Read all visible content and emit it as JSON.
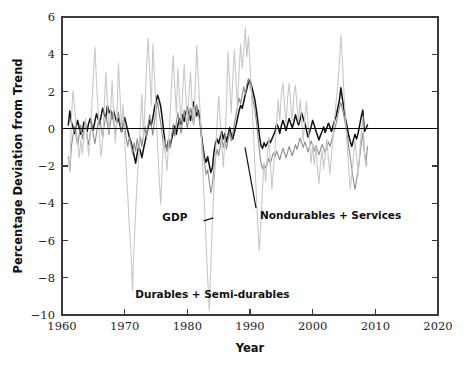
{
  "chart_data": {
    "type": "line",
    "title": "",
    "xlabel": "Year",
    "ylabel": "Percentage Deviation from Trend",
    "xlim": [
      1960,
      2020
    ],
    "ylim": [
      -10,
      6
    ],
    "xticks": [
      1960,
      1970,
      1980,
      1990,
      2000,
      2010,
      2020
    ],
    "xtick_labels": [
      "1960",
      "1970",
      "1980",
      "1990",
      "2000",
      "2010",
      "2020"
    ],
    "yticks": [
      -10,
      -8,
      -6,
      -4,
      -2,
      0,
      2,
      4,
      6
    ],
    "ytick_labels": [
      "−10",
      "−8",
      "−6",
      "−4",
      "−2",
      "0",
      "2",
      "4",
      "6"
    ],
    "grid": false,
    "legend_position": "inline-annotations",
    "zero_reference_line": 0,
    "x_start": 1961.0,
    "x_step": 0.25,
    "annotations": [
      {
        "text": "GDP",
        "x": 1980.0,
        "y": -4.95,
        "leader_to_x": 1982.6,
        "leader_to_y": -4.95
      },
      {
        "text": "Nondurables + Services",
        "x": 1991.6,
        "y": -4.85,
        "leader_to_x": 1989.2,
        "leader_to_y": -1.0
      },
      {
        "text": "Durables + Semi-durables",
        "x": 1984.0,
        "y": -9.1,
        "leader_to_x": null,
        "leader_to_y": null
      }
    ],
    "series": [
      {
        "name": "GDP",
        "color": "#111111",
        "width": 1.5,
        "values": [
          0.2,
          0.95,
          0.35,
          0.1,
          -0.25,
          0.1,
          0.45,
          0.05,
          -0.3,
          -0.1,
          0.35,
          0.2,
          -0.15,
          0.3,
          0.55,
          0.2,
          -0.05,
          0.4,
          0.8,
          0.55,
          0.25,
          0.7,
          1.1,
          0.75,
          0.55,
          1.25,
          0.85,
          1.0,
          0.55,
          0.95,
          0.6,
          0.35,
          0.55,
          0.2,
          -0.15,
          0.25,
          0.6,
          0.25,
          -0.1,
          -0.45,
          -0.7,
          -1.05,
          -1.45,
          -1.85,
          -1.35,
          -0.95,
          -1.2,
          -1.55,
          -1.1,
          -0.7,
          -0.3,
          0.05,
          0.45,
          0.2,
          0.6,
          1.1,
          1.45,
          1.8,
          1.55,
          1.2,
          0.55,
          -0.2,
          -0.85,
          -1.1,
          -0.6,
          -0.95,
          -0.55,
          -0.2,
          0.15,
          -0.3,
          0.2,
          0.55,
          0.25,
          0.75,
          0.4,
          0.85,
          1.15,
          0.85,
          0.45,
          0.9,
          1.45,
          1.05,
          0.7,
          1.0,
          0.55,
          -0.35,
          -1.0,
          -1.55,
          -1.8,
          -1.5,
          -1.95,
          -2.35,
          -2.1,
          -1.25,
          -0.75,
          -0.55,
          -0.8,
          -0.45,
          -0.15,
          -0.55,
          -0.25,
          -0.7,
          -0.35,
          0.05,
          -0.3,
          -0.55,
          -0.2,
          0.15,
          0.55,
          0.95,
          1.25,
          1.1,
          1.45,
          1.85,
          2.15,
          2.5,
          2.6,
          2.3,
          1.95,
          1.6,
          1.05,
          0.4,
          -0.35,
          -0.9,
          -1.05,
          -0.75,
          -0.95,
          -0.8,
          -0.6,
          -0.75,
          -0.55,
          -0.35,
          -0.15,
          0.25,
          0.1,
          -0.25,
          0.15,
          0.45,
          0.2,
          -0.1,
          0.25,
          0.55,
          0.3,
          0.05,
          0.35,
          0.75,
          0.45,
          0.2,
          0.5,
          0.85,
          0.55,
          0.3,
          -0.05,
          -0.45,
          -0.2,
          0.1,
          0.45,
          0.2,
          -0.1,
          -0.35,
          -0.6,
          -0.35,
          -0.15,
          0.1,
          -0.2,
          0.05,
          0.3,
          0.1,
          -0.15,
          0.15,
          0.45,
          0.7,
          1.1,
          1.5,
          2.2,
          1.6,
          1.05,
          0.55,
          0.1,
          -0.35,
          -0.7,
          -0.95,
          -0.6,
          -0.3,
          -0.55,
          -0.25,
          0.2,
          0.65,
          1.0,
          -0.15,
          0.0,
          0.2
        ]
      },
      {
        "name": "Nondurables + Services",
        "color": "#8c8c8c",
        "width": 1.1,
        "values": [
          -1.5,
          -2.25,
          -0.95,
          -0.35,
          0.1,
          -0.45,
          -0.9,
          -0.3,
          0.2,
          -0.55,
          -0.1,
          0.35,
          -0.4,
          -0.85,
          -0.3,
          0.25,
          -0.35,
          -0.8,
          -0.25,
          0.3,
          0.55,
          0.05,
          -0.45,
          0.2,
          0.7,
          0.25,
          -0.3,
          0.35,
          0.85,
          0.3,
          -0.25,
          0.4,
          0.9,
          0.35,
          -0.2,
          0.45,
          0.15,
          -0.5,
          -0.95,
          -0.45,
          -0.85,
          -1.35,
          -0.75,
          -1.2,
          -0.55,
          -1.05,
          -0.45,
          -0.95,
          -0.4,
          0.1,
          -0.45,
          0.25,
          0.75,
          0.2,
          -0.35,
          0.4,
          0.95,
          1.45,
          0.85,
          0.3,
          -0.35,
          -1.1,
          -0.65,
          -1.25,
          -0.55,
          -1.05,
          -0.35,
          0.25,
          -0.4,
          0.35,
          0.85,
          0.35,
          -0.25,
          0.45,
          1.0,
          0.5,
          0.05,
          0.6,
          1.1,
          0.65,
          0.2,
          0.75,
          1.3,
          0.8,
          0.3,
          -0.45,
          -1.15,
          -1.85,
          -2.45,
          -2.2,
          -2.85,
          -3.45,
          -2.95,
          -2.2,
          -1.55,
          -1.1,
          -1.45,
          -0.95,
          -0.5,
          -1.0,
          -0.55,
          -1.1,
          -0.6,
          -0.15,
          -0.65,
          -0.25,
          0.25,
          0.7,
          1.2,
          1.65,
          1.35,
          1.8,
          2.25,
          1.85,
          2.4,
          2.7,
          2.35,
          1.95,
          1.5,
          1.05,
          0.45,
          -0.35,
          -1.15,
          -1.85,
          -2.15,
          -1.9,
          -2.1,
          -1.85,
          -1.6,
          -1.85,
          -1.55,
          -1.3,
          -1.5,
          -1.2,
          -1.45,
          -1.65,
          -1.35,
          -1.05,
          -1.3,
          -1.55,
          -1.25,
          -0.95,
          -1.2,
          -1.45,
          -1.15,
          -0.85,
          -1.1,
          -0.8,
          -0.5,
          -0.75,
          -1.0,
          -0.7,
          -0.95,
          -1.25,
          -0.95,
          -0.65,
          -0.9,
          -1.2,
          -0.9,
          -1.15,
          -1.4,
          -1.1,
          -0.85,
          -1.05,
          -1.3,
          -1.0,
          -0.7,
          -0.95,
          -0.65,
          -0.35,
          -0.05,
          0.3,
          0.7,
          1.1,
          1.4,
          1.05,
          0.65,
          0.2,
          -0.35,
          -0.95,
          -1.55,
          -2.15,
          -2.75,
          -3.25,
          -2.75,
          -2.2,
          -1.55,
          -0.85,
          -0.25,
          -1.25,
          -1.85,
          -0.95
        ]
      },
      {
        "name": "Durables + Semi-durables",
        "color": "#c8c8c8",
        "width": 1.1,
        "values": [
          -1.6,
          -2.3,
          0.5,
          2.05,
          1.25,
          0.1,
          -0.85,
          -1.55,
          -0.6,
          -1.35,
          -0.4,
          0.55,
          -0.5,
          -1.45,
          -0.35,
          1.15,
          2.85,
          4.4,
          2.55,
          1.05,
          -0.45,
          -1.5,
          -0.55,
          1.25,
          3.05,
          1.45,
          -0.2,
          0.95,
          2.6,
          0.85,
          -0.75,
          0.45,
          3.5,
          1.8,
          0.1,
          1.3,
          -0.55,
          -2.15,
          -3.65,
          -5.25,
          -6.55,
          -8.7,
          -6.35,
          -4.45,
          -2.75,
          -1.45,
          0.25,
          1.85,
          -0.55,
          1.35,
          3.35,
          4.85,
          3.05,
          1.25,
          4.55,
          2.85,
          1.05,
          -0.85,
          -2.55,
          -4.05,
          -1.95,
          -0.55,
          -1.35,
          -2.25,
          -0.85,
          0.75,
          2.45,
          3.95,
          2.25,
          0.85,
          3.25,
          1.65,
          0.35,
          1.95,
          3.45,
          1.85,
          0.45,
          1.75,
          3.05,
          1.45,
          0.25,
          2.15,
          4.45,
          2.75,
          1.15,
          -0.55,
          -2.35,
          -4.15,
          -6.15,
          -8.05,
          -9.75,
          -7.25,
          -5.05,
          -3.15,
          -1.45,
          0.35,
          1.75,
          0.45,
          -0.85,
          -2.05,
          -0.55,
          1.25,
          4.15,
          2.45,
          0.85,
          2.65,
          4.25,
          2.65,
          1.15,
          3.05,
          4.55,
          3.25,
          4.15,
          5.45,
          3.85,
          4.95,
          3.45,
          1.85,
          0.15,
          -1.65,
          -3.45,
          -5.25,
          -6.55,
          -4.85,
          -3.15,
          -1.85,
          -2.85,
          -1.55,
          -0.45,
          -1.85,
          -3.25,
          -2.15,
          -1.05,
          0.25,
          1.55,
          0.45,
          1.85,
          2.45,
          1.35,
          0.25,
          1.65,
          2.45,
          1.35,
          0.45,
          1.85,
          2.35,
          1.25,
          0.35,
          1.55,
          0.45,
          -0.65,
          0.55,
          1.45,
          0.35,
          -0.75,
          -1.85,
          -0.85,
          -1.95,
          -0.95,
          -2.05,
          -2.95,
          -1.85,
          -1.15,
          -2.15,
          -1.45,
          -0.55,
          -1.55,
          -2.45,
          -1.45,
          -0.45,
          0.55,
          1.45,
          2.35,
          3.45,
          5.05,
          3.55,
          1.85,
          0.45,
          -0.85,
          -2.15,
          -3.25,
          -2.45,
          -1.55,
          -0.65,
          -1.45,
          -2.55,
          -1.35,
          -0.25,
          0.65,
          -1.25,
          -2.05,
          -1.85
        ]
      }
    ]
  }
}
